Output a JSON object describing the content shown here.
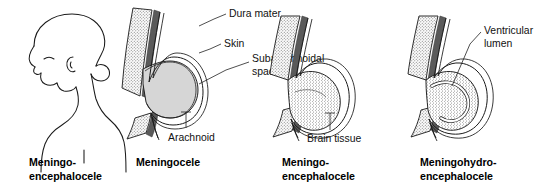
{
  "figure": {
    "background_color": "#ffffff",
    "ink_color": "#1a1a1a"
  },
  "palette": {
    "bone_stipple": "#6f6f6f",
    "bone_fill": "#fbfbfb",
    "dura": "#5a5a5a",
    "csf_sac": "#d6d6d6",
    "brain_stipple": "#7a7a7a",
    "skin_line": "#1a1a1a",
    "text": "#111111"
  },
  "panels": [
    {
      "id": "panel-infant-profile",
      "index": 1,
      "caption_lines": [
        "Meningo-",
        "encephalocele"
      ],
      "caption_full": "Meningo-encephalocele",
      "kind": "infant-profile-drawing",
      "description": "Line drawing of infant head in profile with occipital swelling",
      "annotations": []
    },
    {
      "id": "panel-meningocele",
      "index": 2,
      "caption_lines": [
        "Meningocele"
      ],
      "caption_full": "Meningocele",
      "kind": "cross-section",
      "description": "Skull defect with protruding sac containing only cerebrospinal fluid",
      "annotations": [
        {
          "id": "dura-mater",
          "label": "Dura mater",
          "lines": [
            "Dura mater"
          ]
        },
        {
          "id": "skin",
          "label": "Skin",
          "lines": [
            "Skin"
          ]
        },
        {
          "id": "subarachnoidal-space",
          "label": "Subarachnoidal space",
          "lines": [
            "Subarachnoidal",
            "space"
          ]
        },
        {
          "id": "arachnoid",
          "label": "Arachnoid",
          "lines": [
            "Arachnoid"
          ]
        }
      ]
    },
    {
      "id": "panel-meningoencephalocele",
      "index": 3,
      "caption_lines": [
        "Meningo-",
        "encephalocele"
      ],
      "caption_full": "Meningo-encephalocele",
      "kind": "cross-section",
      "description": "Sac containing herniated brain tissue",
      "annotations": [
        {
          "id": "brain-tissue",
          "label": "Brain tissue",
          "lines": [
            "Brain tissue"
          ]
        }
      ]
    },
    {
      "id": "panel-meningohydroencephalocele",
      "index": 4,
      "caption_lines": [
        "Meningohydro-",
        "encephalocele"
      ],
      "caption_full": "Meningohydro-encephalocele",
      "kind": "cross-section",
      "description": "Sac containing brain tissue with part of the ventricle",
      "annotations": [
        {
          "id": "ventricular-lumen",
          "label": "Ventricular lumen",
          "lines": [
            "Ventricular",
            "lumen"
          ]
        }
      ]
    }
  ]
}
